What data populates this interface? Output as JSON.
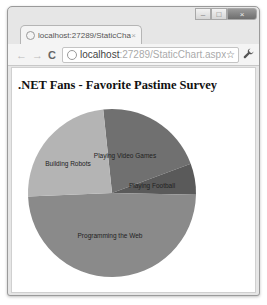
{
  "browser": {
    "tab_title": "localhost:27289/StaticChar",
    "tab_close": "×",
    "url_host": "localhost",
    "url_rest": ":27289/StaticChart.aspx",
    "window_controls": {
      "minimize": "–",
      "maximize": "□",
      "close": "×"
    },
    "icons": {
      "back": "←",
      "forward": "→",
      "reload": "C",
      "star": "☆",
      "wrench": "🔧"
    }
  },
  "page": {
    "title": ".NET Fans - Favorite Pastime Survey"
  },
  "chart_data": {
    "type": "pie",
    "title": ".NET Fans - Favorite Pastime Survey",
    "categories": [
      "Playing Video Games",
      "Building Robots",
      "Programming the Web",
      "Playing Football"
    ],
    "values": [
      21,
      24,
      49,
      6
    ],
    "unit": "percent (estimated from slice angles)",
    "colors": [
      "#707070",
      "#b4b4b4",
      "#8a8a8a",
      "#5a5a5a"
    ],
    "legend": "none (labels drawn on slices)"
  }
}
